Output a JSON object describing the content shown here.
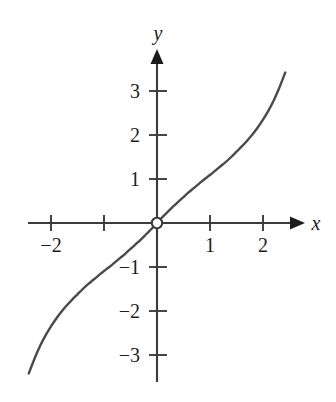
{
  "figure": {
    "background_color": "#ffffff",
    "axis_color": "#3b3b3b",
    "curve_color": "#4a4a4a",
    "text_color": "#1c1c1c",
    "origin_marker": {
      "name": "open-circle",
      "fill": "#ffffff",
      "stroke": "#3b3b3b",
      "x": 0,
      "y": 0
    }
  },
  "chart_data": {
    "type": "line",
    "title": "",
    "subtitle": "",
    "xlabel": "x",
    "ylabel": "y",
    "xlim": [
      -2.65,
      2.7
    ],
    "ylim": [
      -3.6,
      3.7
    ],
    "grid": false,
    "legend": null,
    "x_ticks": [
      -2,
      -1,
      1,
      2
    ],
    "x_tick_labels": [
      "−2",
      "",
      "1",
      "2"
    ],
    "y_ticks": [
      -3,
      -2,
      -1,
      1,
      2,
      3
    ],
    "y_tick_labels": [
      "−3",
      "−2",
      "−1",
      "1",
      "2",
      "3"
    ],
    "annotations": [
      {
        "name": "origin-open-point",
        "x": 0,
        "y": 0,
        "style": "open-circle",
        "label": ""
      }
    ],
    "series": [
      {
        "name": "curve",
        "style": "solid",
        "color": "#4a4a4a",
        "x": [
          -2.42,
          -2.3,
          -2.2,
          -2.1,
          -2.0,
          -1.9,
          -1.8,
          -1.7,
          -1.6,
          -1.5,
          -1.4,
          -1.3,
          -1.2,
          -1.1,
          -1.0,
          -0.9,
          -0.8,
          -0.7,
          -0.6,
          -0.5,
          -0.4,
          -0.3,
          -0.2,
          -0.1,
          0.0,
          0.1,
          0.2,
          0.3,
          0.4,
          0.5,
          0.6,
          0.7,
          0.8,
          0.9,
          1.0,
          1.1,
          1.2,
          1.3,
          1.4,
          1.5,
          1.6,
          1.7,
          1.8,
          1.9,
          2.0,
          2.1,
          2.2,
          2.3,
          2.42
        ],
        "y": [
          -3.42,
          -3.05,
          -2.78,
          -2.55,
          -2.35,
          -2.17,
          -2.01,
          -1.87,
          -1.74,
          -1.62,
          -1.5,
          -1.39,
          -1.29,
          -1.19,
          -1.09,
          -1.0,
          -0.9,
          -0.8,
          -0.7,
          -0.59,
          -0.48,
          -0.37,
          -0.25,
          -0.13,
          0.0,
          0.13,
          0.25,
          0.37,
          0.48,
          0.59,
          0.7,
          0.8,
          0.9,
          1.0,
          1.09,
          1.19,
          1.29,
          1.39,
          1.5,
          1.62,
          1.74,
          1.87,
          2.01,
          2.17,
          2.35,
          2.55,
          2.78,
          3.05,
          3.42
        ]
      }
    ]
  },
  "axes": {
    "x_axis_label": "x",
    "y_axis_label": "y",
    "x_arrow": "arrow-right",
    "y_arrow": "arrow-up"
  }
}
